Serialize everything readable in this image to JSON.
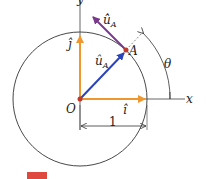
{
  "diagram": {
    "type": "unit-circle-vector-diagram",
    "axes": {
      "x_label": "x",
      "y_label": "y"
    },
    "origin_label": "O",
    "point_label": "A",
    "angle_label": "θ",
    "radius_label": "1",
    "vectors": {
      "i_hat": "î",
      "j_hat": "ĵ",
      "u_A": "û",
      "u_A_sub": "A",
      "u_A_dot": "u̇̂",
      "u_A_dot_sub": "A"
    },
    "colors": {
      "unit_axes": "#f0962e",
      "u_A": "#2b45b8",
      "u_A_dot": "#7a3a8c",
      "point": "#c0392b",
      "circle": "#333333",
      "figure_mark": "#d9281c"
    }
  }
}
